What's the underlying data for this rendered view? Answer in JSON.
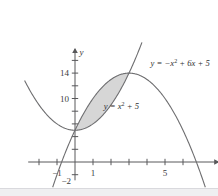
{
  "figure": {
    "background_color": "#ffffff",
    "axis_color": "#58585a",
    "curve_color": "#6e6e70",
    "shade_color": "#d6d6d6",
    "bottom_band_color": "#efeff1"
  },
  "axes": {
    "x_axis_label": "x",
    "y_axis_label": "y",
    "x_ticks": [
      {
        "value": -2,
        "label": ""
      },
      {
        "value": -1,
        "label": "-1"
      },
      {
        "value": 1,
        "label": "1"
      },
      {
        "value": 2,
        "label": ""
      },
      {
        "value": 3,
        "label": ""
      },
      {
        "value": 4,
        "label": ""
      },
      {
        "value": 5,
        "label": "5"
      },
      {
        "value": 6,
        "label": ""
      }
    ],
    "y_ticks": [
      {
        "value": -2,
        "label": "-2"
      },
      {
        "value": 2,
        "label": ""
      },
      {
        "value": 4,
        "label": ""
      },
      {
        "value": 6,
        "label": ""
      },
      {
        "value": 8,
        "label": ""
      },
      {
        "value": 10,
        "label": "10"
      },
      {
        "value": 12,
        "label": ""
      },
      {
        "value": 14,
        "label": "14"
      },
      {
        "value": 16,
        "label": ""
      }
    ],
    "x_range": [
      -2.6,
      7.4
    ],
    "y_range": [
      -3.2,
      17.5
    ],
    "grid": false
  },
  "labels": {
    "upper_curve_eq_prefix": "y = -x",
    "upper_curve_eq_sup": "2",
    "upper_curve_eq_suffix": " + 6x + 5",
    "lower_curve_eq_prefix": "y = x",
    "lower_curve_eq_sup": "2",
    "lower_curve_eq_suffix": " + 5"
  },
  "chart_data": {
    "type": "line",
    "xlabel": "x",
    "ylabel": "y",
    "xlim": [
      -2.6,
      7.4
    ],
    "ylim": [
      -3.2,
      17.5
    ],
    "grid": false,
    "legend": "inline-curve-labels",
    "x_tick_labels": [
      "-1",
      "1",
      "5"
    ],
    "y_tick_labels": [
      "-2",
      "10",
      "14"
    ],
    "series": [
      {
        "name": "y = -x^2 + 6x + 5",
        "equation": "y = -x^2 + 6x + 5",
        "type": "parabola-down",
        "coefficients": {
          "a": -1,
          "b": 6,
          "c": 5
        },
        "vertex": [
          3,
          14
        ],
        "x_intercepts": [
          -0.742,
          6.742
        ],
        "y_intercept": 5,
        "label_position": [
          4.2,
          15.1
        ]
      },
      {
        "name": "y = x^2 + 5",
        "equation": "y = x^2 + 5",
        "type": "parabola-up",
        "coefficients": {
          "a": 1,
          "b": 0,
          "c": 5
        },
        "vertex": [
          0,
          5
        ],
        "x_intercepts": [],
        "y_intercept": 5,
        "label_position": [
          1.6,
          8.4
        ]
      }
    ],
    "shaded_region": {
      "description": "Region enclosed between the two parabolas",
      "fill_color": "#d6d6d6",
      "intersection_points": [
        [
          0,
          5
        ],
        [
          3,
          14
        ]
      ],
      "bounds_x": [
        0,
        3
      ],
      "upper_boundary": "y = -x^2 + 6x + 5",
      "lower_boundary": "y = x^2 + 5",
      "area": 9
    },
    "annotations": [
      {
        "text": "y = -x^2 + 6x + 5",
        "x": 4.2,
        "y": 15.1
      },
      {
        "text": "y = x^2 + 5",
        "x": 1.6,
        "y": 8.4
      }
    ]
  }
}
